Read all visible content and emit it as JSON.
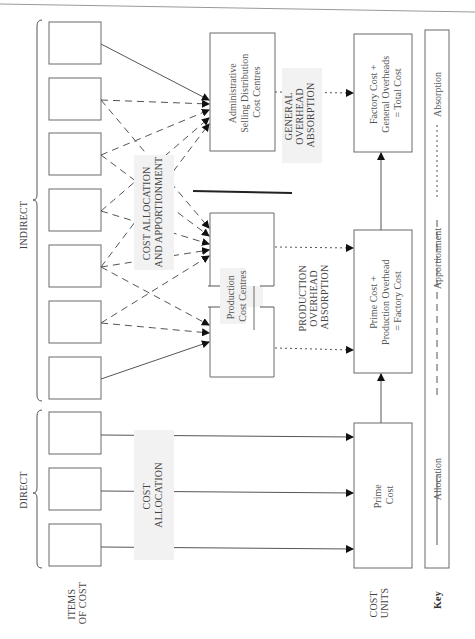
{
  "diagram": {
    "orientation": "rotated-90-ccw",
    "groups": {
      "indirect_label": "INDIRECT",
      "direct_label": "DIRECT",
      "items_of_cost_label_line1": "ITEMS",
      "items_of_cost_label_line2": "OF COST",
      "cost_units_label_line1": "COST",
      "cost_units_label_line2": "UNITS",
      "key_label": "Key"
    },
    "item_boxes": {
      "indirect_count": 7,
      "direct_count": 3
    },
    "process_labels": {
      "cost_allocation_apportionment_line1": "COST ALLOCATION",
      "cost_allocation_apportionment_line2": "AND APPORTIONMENT",
      "cost_allocation_line1": "COST",
      "cost_allocation_line2": "ALLOCATION",
      "production_absorption_line1": "PRODUCTION",
      "production_absorption_line2": "OVERHEAD",
      "production_absorption_line3": "ABSORPTION",
      "general_absorption_line1": "GENERAL",
      "general_absorption_line2": "OVERHEAD",
      "general_absorption_line3": "ABSORPTION"
    },
    "cost_centres": {
      "admin_line1": "Administrative",
      "admin_line2": "Selling Distribution",
      "admin_line3": "Cost Centres",
      "production_line1": "Production",
      "production_line2": "Cost Centres"
    },
    "cost_units": {
      "prime_line1": "Prime",
      "prime_line2": "Cost",
      "factory_line1": "Prime Cost +",
      "factory_line2": "Production Overhead",
      "factory_line3": "= Factory Cost",
      "total_line1": "Factory Cost +",
      "total_line2": "General Overheads",
      "total_line3": "= Total Cost"
    },
    "key": {
      "allocation": "Allocation",
      "apportionment": "Apportionment",
      "absorption": "Absorption"
    }
  }
}
